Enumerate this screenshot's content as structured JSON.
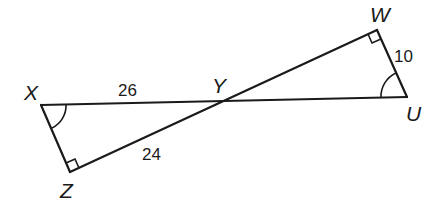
{
  "diagram": {
    "vertices": {
      "X": {
        "label": "X",
        "x": 41,
        "y": 105
      },
      "Y": {
        "label": "Y",
        "x": 222,
        "y": 101
      },
      "Z": {
        "label": "Z",
        "x": 70,
        "y": 172
      },
      "W": {
        "label": "W",
        "x": 377,
        "y": 30
      },
      "U": {
        "label": "U",
        "x": 407,
        "y": 97
      }
    },
    "segments": [
      {
        "from": "X",
        "to": "U"
      },
      {
        "from": "Z",
        "to": "W"
      },
      {
        "from": "X",
        "to": "Z"
      },
      {
        "from": "W",
        "to": "U"
      }
    ],
    "lengths": {
      "XY": "26",
      "ZY": "24",
      "WU": "10"
    },
    "right_angles": [
      "Z",
      "W"
    ],
    "congruent_angles": [
      "X",
      "U"
    ]
  }
}
